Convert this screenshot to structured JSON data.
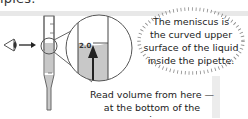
{
  "header": {
    "partial_text": "ipies."
  },
  "diagram": {
    "scale_label": "2.0",
    "eye_icon": "eye-icon",
    "arrow_icon": "arrow-right-icon",
    "colors": {
      "liquid": "#c8c8c8",
      "outline": "#555555",
      "arrow": "#222222",
      "band": "#e8e8e8"
    }
  },
  "callout": {
    "lines": [
      "The meniscus is",
      "the curved upper",
      "surface of the liquid",
      "inside the pipette."
    ]
  },
  "caption": {
    "lines": [
      "Read volume from here —",
      "at the bottom of the meniscus."
    ]
  }
}
